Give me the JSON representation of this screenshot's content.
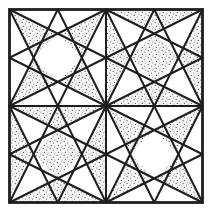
{
  "figure": {
    "colors": {
      "background": "#ffffff",
      "line": "#1e1e1e",
      "stipple_dot": "#6a6a6a",
      "stipple_base": "#f6f6f6"
    },
    "outer_square": {
      "x": 9.5,
      "y": 9.5,
      "size": 193
    },
    "quadrants": [
      {
        "name": "top-left",
        "shading": "star-arms"
      },
      {
        "name": "top-right",
        "shading": "edges-and-center"
      },
      {
        "name": "bottom-left",
        "shading": "edges-and-center"
      },
      {
        "name": "bottom-right",
        "shading": "star-arms"
      }
    ]
  }
}
